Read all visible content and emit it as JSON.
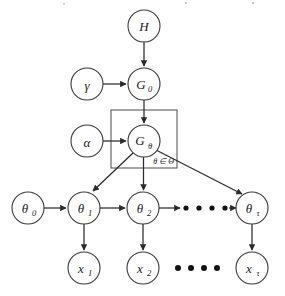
{
  "diagram": {
    "type": "probabilistic-graphical-model",
    "background_color": "#ffffff",
    "node_stroke_color": "#3a3a3a",
    "edge_color": "#2b2b2b",
    "plate_stroke_color": "#4a4a4a",
    "nodes": [
      {
        "id": "H",
        "base": "H",
        "sub": "",
        "cx": 144,
        "cy": 26,
        "r": 16
      },
      {
        "id": "gamma",
        "base": "γ",
        "sub": "",
        "cx": 87,
        "cy": 84,
        "r": 16
      },
      {
        "id": "G0",
        "base": "G",
        "sub": "0",
        "cx": 144,
        "cy": 84,
        "r": 16
      },
      {
        "id": "alpha",
        "base": "α",
        "sub": "",
        "cx": 87,
        "cy": 141,
        "r": 16
      },
      {
        "id": "Gtheta",
        "base": "G",
        "sub": "θ",
        "cx": 144,
        "cy": 141,
        "r": 16
      },
      {
        "id": "theta0",
        "base": "θ",
        "sub": "0",
        "cx": 28,
        "cy": 208,
        "r": 16
      },
      {
        "id": "theta1",
        "base": "θ",
        "sub": "1",
        "cx": 84,
        "cy": 208,
        "r": 16
      },
      {
        "id": "theta2",
        "base": "θ",
        "sub": "2",
        "cx": 143,
        "cy": 208,
        "r": 16
      },
      {
        "id": "thetaT",
        "base": "θ",
        "sub": "τ",
        "cx": 252,
        "cy": 208,
        "r": 16
      },
      {
        "id": "x1",
        "base": "x",
        "sub": "1",
        "cx": 84,
        "cy": 268,
        "r": 16
      },
      {
        "id": "x2",
        "base": "x",
        "sub": "2",
        "cx": 143,
        "cy": 268,
        "r": 16
      },
      {
        "id": "xT",
        "base": "x",
        "sub": "τ",
        "cx": 252,
        "cy": 268,
        "r": 16
      }
    ],
    "plate": {
      "label": "θ ∈ Θ",
      "x": 111,
      "y": 110,
      "width": 66,
      "height": 58,
      "label_x": 174,
      "label_y": 161
    },
    "edges": [
      {
        "from": "H",
        "to": "G0",
        "kind": "vertical"
      },
      {
        "from": "gamma",
        "to": "G0",
        "kind": "horizontal"
      },
      {
        "from": "G0",
        "to": "Gtheta",
        "kind": "vertical"
      },
      {
        "from": "alpha",
        "to": "Gtheta",
        "kind": "horizontal"
      },
      {
        "from": "Gtheta",
        "to": "theta1",
        "kind": "diagonal"
      },
      {
        "from": "Gtheta",
        "to": "theta2",
        "kind": "vertical"
      },
      {
        "from": "Gtheta",
        "to": "thetaT",
        "kind": "diagonal"
      },
      {
        "from": "theta0",
        "to": "theta1",
        "kind": "horizontal"
      },
      {
        "from": "theta1",
        "to": "theta2",
        "kind": "horizontal"
      },
      {
        "from": "theta2",
        "to": "dots-theta",
        "kind": "horizontal"
      },
      {
        "from": "dots-theta",
        "to": "thetaT",
        "kind": "horizontal"
      },
      {
        "from": "theta1",
        "to": "x1",
        "kind": "vertical"
      },
      {
        "from": "theta2",
        "to": "x2",
        "kind": "vertical"
      },
      {
        "from": "thetaT",
        "to": "xT",
        "kind": "vertical"
      }
    ],
    "ellipsis_theta_row": {
      "count": 4,
      "cy": 208,
      "dots_x": [
        186,
        199,
        212,
        225
      ],
      "radius": 2.6,
      "arrow_start_x": 160,
      "arrow_stub_end_x": 180,
      "arrow_resume_x": 231,
      "arrow_end_x": 234
    },
    "ellipsis_x_row": {
      "count": 4,
      "cy": 268,
      "dots_x": [
        178,
        191,
        204,
        217
      ],
      "radius": 3.0
    }
  }
}
